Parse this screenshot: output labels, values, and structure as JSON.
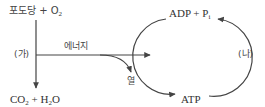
{
  "diagram": {
    "type": "cellular-respiration-atp-cycle",
    "reactants": {
      "part1": "포도당 + O",
      "sub": "2"
    },
    "products": {
      "co": "CO",
      "co_sub": "2",
      "plus_h": " + H",
      "h_sub": "2",
      "o": "O"
    },
    "process_label_a": "(가)",
    "energy_label": "에너지",
    "heat_label": "열",
    "cycle": {
      "top": {
        "main": "ADP + P",
        "sub": "i"
      },
      "bottom": "ATP",
      "process_label_b": "(나)"
    },
    "colors": {
      "line": "#444444",
      "text": "#333333"
    }
  }
}
